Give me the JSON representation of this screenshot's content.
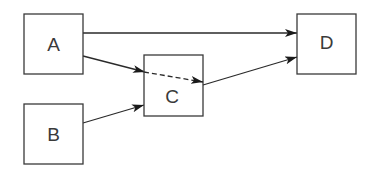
{
  "diagram": {
    "nodes": [
      {
        "id": "A",
        "label": "A",
        "x": 24,
        "y": 14,
        "w": 59,
        "h": 60
      },
      {
        "id": "B",
        "label": "B",
        "x": 24,
        "y": 104,
        "w": 59,
        "h": 60
      },
      {
        "id": "C",
        "label": "C",
        "x": 144,
        "y": 55,
        "w": 59,
        "h": 61
      },
      {
        "id": "D",
        "label": "D",
        "x": 297,
        "y": 14,
        "w": 59,
        "h": 60
      }
    ],
    "edges": [
      {
        "from": "A",
        "to": "D",
        "style": "solid",
        "arrow": true
      },
      {
        "from": "A",
        "to": "C",
        "style": "solid",
        "arrow": true
      },
      {
        "from": "B",
        "to": "C",
        "style": "solid",
        "arrow": true
      },
      {
        "from": "A",
        "to": "C-internal",
        "style": "dashed",
        "arrow": true,
        "note": "dashed continuation through C"
      },
      {
        "from": "C",
        "to": "D",
        "style": "solid",
        "arrow": true
      }
    ],
    "colors": {
      "stroke": "#3a3a3a",
      "background": "#ffffff"
    }
  }
}
